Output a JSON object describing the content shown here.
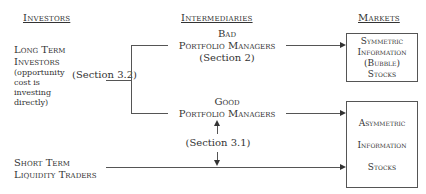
{
  "headers": {
    "investors": "Investors",
    "intermediaries": "Intermediaries",
    "markets": "Markets"
  },
  "investors": {
    "long_term": {
      "line1": "Long Term",
      "line2": "Investors",
      "note": [
        "(opportunity",
        "cost is",
        "investing",
        "directly)"
      ]
    },
    "short_term": {
      "line1": "Short Term",
      "line2": "Liquidity Traders"
    }
  },
  "intermediaries": {
    "bad": {
      "line1": "Bad",
      "line2": "Portfolio Managers",
      "section": "(Section 2)"
    },
    "good": {
      "line1": "Good",
      "line2": "Portfolio Managers"
    },
    "section_3_1": "(Section 3.1)",
    "section_3_2": "(Section 3.2)"
  },
  "markets": {
    "symmetric": [
      "Symmetric",
      "Information",
      "(Bubble)",
      "Stocks"
    ],
    "asymmetric": [
      "Asymmetric",
      "Information",
      "Stocks"
    ]
  }
}
